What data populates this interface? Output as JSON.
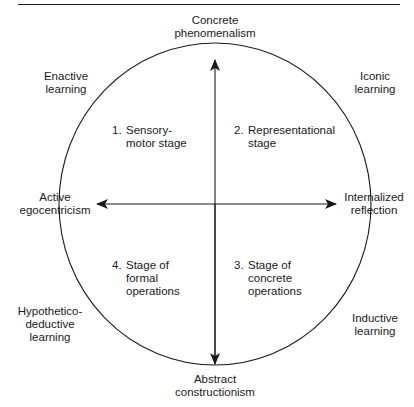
{
  "axes": {
    "top": [
      "Concrete",
      "phenomenalism"
    ],
    "bottom": [
      "Abstract",
      "constructionism"
    ],
    "left": [
      "Active",
      "egocentricism"
    ],
    "right": [
      "Internalized",
      "reflection"
    ]
  },
  "corners": {
    "top_left": [
      "Enactive",
      "learning"
    ],
    "top_right": [
      "Iconic",
      "learning"
    ],
    "bottom_left": [
      "Hypothetico-",
      "deductive",
      "learning"
    ],
    "bottom_right": [
      "Inductive",
      "learning"
    ]
  },
  "stages": [
    {
      "num": "1.",
      "lines": [
        "Sensory-",
        "motor stage"
      ]
    },
    {
      "num": "2.",
      "lines": [
        "Representational",
        "stage"
      ]
    },
    {
      "num": "3.",
      "lines": [
        "Stage of",
        "concrete",
        "operations"
      ]
    },
    {
      "num": "4.",
      "lines": [
        "Stage of",
        "formal",
        "operations"
      ]
    }
  ],
  "colors": {
    "stroke": "#1a1a1a",
    "background": "#ffffff"
  }
}
